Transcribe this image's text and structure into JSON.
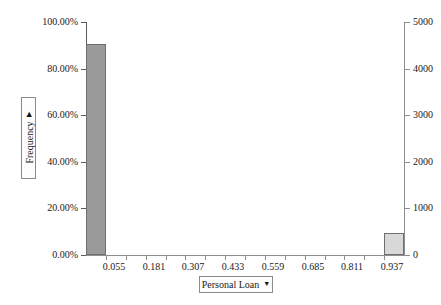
{
  "chart_data": {
    "type": "bar",
    "title": "",
    "subtitle": "",
    "xlabel": "Personal Loan",
    "ylabel": "Frequency",
    "grid": false,
    "legend": null,
    "bin_width": 0.063,
    "categories": [
      "0.055",
      "0.181",
      "0.307",
      "0.433",
      "0.559",
      "0.685",
      "0.811",
      "0.937"
    ],
    "x_tick_labels": [
      "0.055",
      "0.181",
      "0.307",
      "0.433",
      "0.559",
      "0.685",
      "0.811",
      "0.937"
    ],
    "x_tick_values": [
      0.055,
      0.181,
      0.307,
      0.433,
      0.559,
      0.685,
      0.811,
      0.937
    ],
    "xlim": [
      -0.008,
      1.0
    ],
    "y_left_axis": {
      "label": "Frequency",
      "tick_labels": [
        "0.00%",
        "20.00%",
        "40.00%",
        "60.00%",
        "80.00%",
        "100.00%"
      ],
      "tick_values": [
        0,
        20,
        40,
        60,
        80,
        100
      ],
      "ylim": [
        0,
        100
      ],
      "unit": "%"
    },
    "y_right_axis": {
      "label": "",
      "tick_labels": [
        "0",
        "1000",
        "2000",
        "3000",
        "4000",
        "5000"
      ],
      "tick_values": [
        0,
        1000,
        2000,
        3000,
        4000,
        5000
      ],
      "ylim": [
        0,
        5000
      ],
      "unit": "count"
    },
    "bars": [
      {
        "name": "bin-0",
        "x_center": 0.024,
        "x_left": -0.008,
        "x_right": 0.055,
        "percent": 90.4,
        "count": 4520,
        "color": "#9a9a9a",
        "edge_color": "#6f6f6f"
      },
      {
        "name": "bin-1",
        "x_center": 0.968,
        "x_left": 0.937,
        "x_right": 1.0,
        "percent": 9.6,
        "count": 480,
        "color": "#d8d8d8",
        "edge_color": "#6f6f6f"
      }
    ],
    "annotations": []
  },
  "axes": {
    "y_title": {
      "label": "Frequency",
      "caret": "▶",
      "icon": "triangle-right-icon"
    },
    "x_title": {
      "label": "Personal Loan",
      "caret": "▼",
      "icon": "triangle-down-icon"
    }
  },
  "colors": {
    "bar_primary": "#9a9a9a",
    "bar_secondary": "#d8d8d8",
    "bar_edge": "#6f6f6f",
    "axis_left": "#5b5b5b",
    "axis_right": "#8e8e8e",
    "text": "#1a1a1a",
    "background": "#ffffff"
  }
}
